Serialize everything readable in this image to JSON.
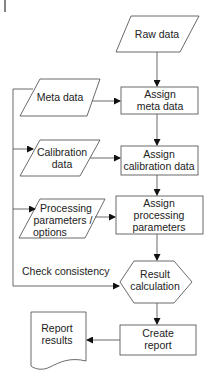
{
  "diagram": {
    "type": "flowchart",
    "nodes": {
      "raw_data": {
        "shape": "parallelogram",
        "label": "Raw data"
      },
      "meta_data": {
        "shape": "parallelogram",
        "label": "Meta data"
      },
      "calibration_data": {
        "shape": "parallelogram",
        "lines": [
          "Calibration",
          "data"
        ]
      },
      "processing_parameters": {
        "shape": "parallelogram",
        "lines": [
          "Processing",
          "parameters /",
          "options"
        ]
      },
      "assign_meta_data": {
        "shape": "rectangle",
        "lines": [
          "Assign",
          "meta data"
        ]
      },
      "assign_calibration_data": {
        "shape": "rectangle",
        "lines": [
          "Assign",
          "calibration data"
        ]
      },
      "assign_processing_parameters": {
        "shape": "rectangle",
        "lines": [
          "Assign",
          "processing",
          "parameters"
        ]
      },
      "result_calculation": {
        "shape": "hexagon",
        "lines": [
          "Result",
          "calculation"
        ]
      },
      "create_report": {
        "shape": "rectangle",
        "lines": [
          "Create",
          "report"
        ]
      },
      "report_results": {
        "shape": "document",
        "lines": [
          "Report",
          "results"
        ]
      }
    },
    "edges": [
      {
        "from": "raw_data",
        "to": "assign_meta_data"
      },
      {
        "from": "meta_data",
        "to": "assign_meta_data"
      },
      {
        "from": "assign_meta_data",
        "to": "assign_calibration_data"
      },
      {
        "from": "calibration_data",
        "to": "assign_calibration_data"
      },
      {
        "from": "assign_calibration_data",
        "to": "assign_processing_parameters"
      },
      {
        "from": "processing_parameters",
        "to": "assign_processing_parameters"
      },
      {
        "from": "assign_processing_parameters",
        "to": "result_calculation"
      },
      {
        "from": "result_calculation",
        "to": "create_report"
      },
      {
        "from": "create_report",
        "to": "report_results"
      },
      {
        "from": "feedback_loop",
        "to": [
          "meta_data",
          "calibration_data",
          "processing_parameters",
          "result_calculation"
        ],
        "label": "Check consistency"
      }
    ],
    "feedback_label": "Check consistency",
    "colors": {
      "stroke": "#5a5a5a",
      "text": "#222222",
      "arrow": "#111111",
      "background": "#ffffff"
    }
  }
}
